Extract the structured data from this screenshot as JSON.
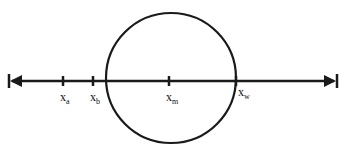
{
  "diagram": {
    "type": "number-line-with-circle",
    "line": {
      "x1": 8,
      "x2": 338,
      "y": 81,
      "color": "#1a1a1a",
      "arrows": "both"
    },
    "circle": {
      "cx": 171,
      "cy": 78,
      "r": 65,
      "color": "#1a1a1a"
    },
    "points": [
      {
        "id": "xa",
        "base": "x",
        "sub": "a",
        "x": 63
      },
      {
        "id": "xb",
        "base": "x",
        "sub": "b",
        "x": 93
      },
      {
        "id": "xm",
        "base": "x",
        "sub": "m",
        "x": 169
      },
      {
        "id": "xw",
        "base": "x",
        "sub": "w",
        "x": 236
      }
    ]
  }
}
